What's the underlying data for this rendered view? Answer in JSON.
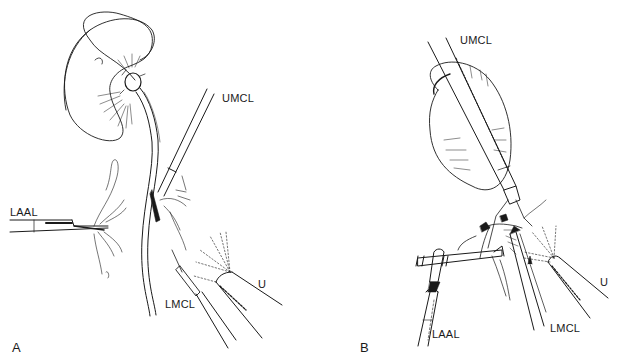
{
  "figure": {
    "panels": [
      {
        "id": "A",
        "label": "A",
        "instrument_labels": {
          "umcl": "UMCL",
          "laal": "LAAL",
          "lmcl": "LMCL",
          "u": "U"
        }
      },
      {
        "id": "B",
        "label": "B",
        "instrument_labels": {
          "umcl": "UMCL",
          "laal": "LAAL",
          "lmcl": "LMCL",
          "u": "U"
        }
      }
    ],
    "colors": {
      "line": "#1a1a1a",
      "background": "#ffffff"
    }
  }
}
